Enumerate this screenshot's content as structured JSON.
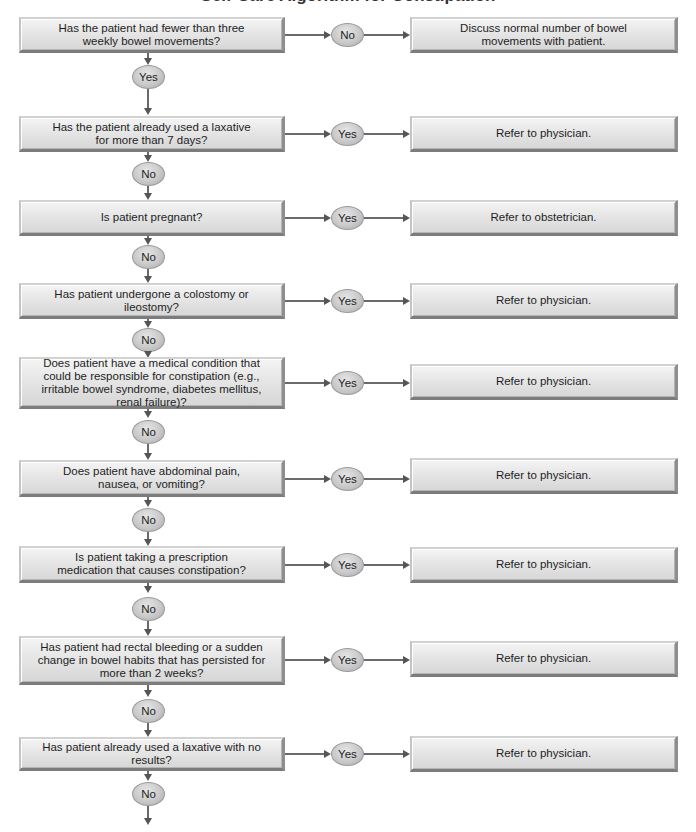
{
  "diagram": {
    "title": "Self-Care Algorithm for Constipation",
    "rows": [
      {
        "question": "Has the patient had fewer than three weekly bowel movements?",
        "branch_label": "No",
        "outcome": "Discuss normal number of bowel movements with patient.",
        "continue_label": "Yes"
      },
      {
        "question": "Has the patient already used a laxative for more than 7 days?",
        "branch_label": "Yes",
        "outcome": "Refer to physician.",
        "continue_label": "No"
      },
      {
        "question": "Is patient pregnant?",
        "branch_label": "Yes",
        "outcome": "Refer to obstetrician.",
        "continue_label": "No"
      },
      {
        "question": "Has patient undergone a colostomy or ileostomy?",
        "branch_label": "Yes",
        "outcome": "Refer to physician.",
        "continue_label": "No"
      },
      {
        "question": "Does patient have a medical condition that could be responsible for constipation (e.g., irritable bowel syndrome, diabetes mellitus, renal failure)?",
        "branch_label": "Yes",
        "outcome": "Refer to physician.",
        "continue_label": "No"
      },
      {
        "question": "Does patient have abdominal pain, nausea, or vomiting?",
        "branch_label": "Yes",
        "outcome": "Refer to physician.",
        "continue_label": "No"
      },
      {
        "question": "Is patient taking a prescription medication that causes constipation?",
        "branch_label": "Yes",
        "outcome": "Refer to physician.",
        "continue_label": "No"
      },
      {
        "question": "Has patient had rectal bleeding or a sudden change in bowel habits that has persisted for more than 2 weeks?",
        "branch_label": "Yes",
        "outcome": "Refer to physician.",
        "continue_label": "No"
      },
      {
        "question": "Has patient already used a laxative with no results?",
        "branch_label": "Yes",
        "outcome": "Refer to physician.",
        "continue_label": "No"
      }
    ],
    "colors": {
      "box_light": "#f4f4f4",
      "box_dark": "#d6d6d6",
      "oval": "#c9c9c9",
      "connector": "#6a6a6a"
    }
  }
}
